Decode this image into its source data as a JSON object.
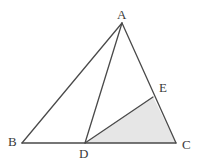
{
  "figure": {
    "type": "geometry-diagram",
    "width": 198,
    "height": 163,
    "background_color": "#ffffff",
    "stroke_color": "#4a4a4a",
    "stroke_width": 1.3,
    "shaded_fill_color": "#e6e6e6",
    "shaded_region": "DEC",
    "label_color": "#3a3a3a",
    "points": [
      {
        "name": "A",
        "label": "A",
        "x": 122,
        "y": 23,
        "label_x": 117,
        "label_y": 8
      },
      {
        "name": "B",
        "label": "B",
        "x": 22,
        "y": 143,
        "label_x": 8,
        "label_y": 135
      },
      {
        "name": "C",
        "label": "C",
        "x": 176,
        "y": 143,
        "label_x": 182,
        "label_y": 138
      },
      {
        "name": "D",
        "label": "D",
        "x": 85,
        "y": 143,
        "label_x": 79,
        "label_y": 147
      },
      {
        "name": "E",
        "label": "E",
        "x": 153,
        "y": 97,
        "label_x": 159,
        "label_y": 81
      }
    ],
    "segments": [
      {
        "name": "AB",
        "from": "A",
        "to": "B"
      },
      {
        "name": "BC",
        "from": "B",
        "to": "C"
      },
      {
        "name": "AC",
        "from": "A",
        "to": "C"
      },
      {
        "name": "AD",
        "from": "A",
        "to": "D"
      },
      {
        "name": "DE",
        "from": "D",
        "to": "E"
      }
    ],
    "polygons": [
      {
        "name": "triangle-dec",
        "vertices": [
          "D",
          "E",
          "C"
        ],
        "filled": true
      }
    ]
  }
}
